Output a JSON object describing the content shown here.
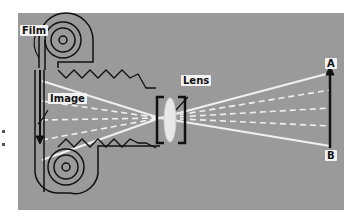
{
  "figure": {
    "colors": {
      "background": "#9a9a9a",
      "outline": "#111111",
      "rays": "#f0f0f0",
      "label_bg": "#f2f2f2"
    }
  },
  "labels": {
    "film": "Film",
    "image": "Image",
    "lens": "Lens",
    "point_a": "A",
    "point_b": "B"
  }
}
